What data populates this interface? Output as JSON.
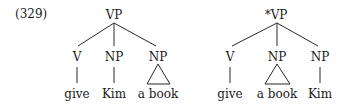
{
  "example_number": "(329)",
  "trees": [
    {
      "root": "VP",
      "grammatical": true,
      "children": [
        {
          "label": "V",
          "word": "give",
          "phrasal": false
        },
        {
          "label": "NP",
          "word": "Kim",
          "phrasal": false
        },
        {
          "label": "NP",
          "word": "a book",
          "phrasal": true
        }
      ]
    },
    {
      "root": "*VP",
      "grammatical": false,
      "children": [
        {
          "label": "V",
          "word": "give",
          "phrasal": false
        },
        {
          "label": "NP",
          "word": "a book",
          "phrasal": true
        },
        {
          "label": "NP",
          "word": "Kim",
          "phrasal": false
        }
      ]
    }
  ]
}
